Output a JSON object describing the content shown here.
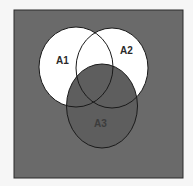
{
  "diagram": {
    "type": "venn",
    "colors": {
      "page": "#f6f6f6",
      "background": "#6a6a6a",
      "border": "#2a2a2a",
      "shaded_fill": "#ffffff",
      "outline": "#1a1a1a",
      "label_light": "#2a2a2a",
      "label_dark": "#3c3c3c"
    },
    "sets": [
      {
        "label": "A1",
        "region": "shaded (white)"
      },
      {
        "label": "A2",
        "region": "shaded (white)"
      },
      {
        "label": "A3",
        "region": "unshaded (gray)"
      }
    ],
    "shaded_expression": "(A1 ∪ A2) − A3"
  }
}
